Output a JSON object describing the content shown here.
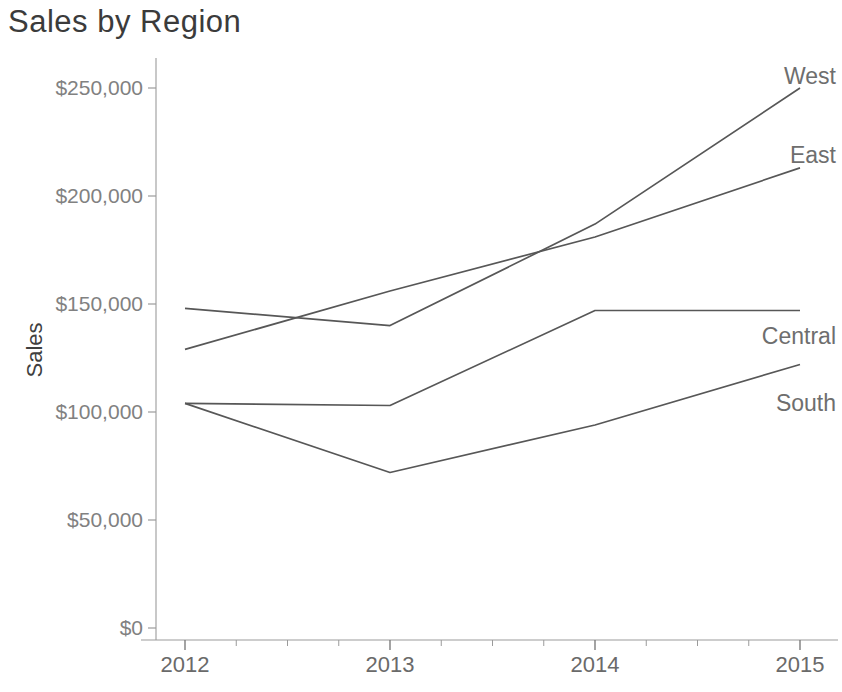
{
  "page": {
    "background_color": "#ffffff"
  },
  "chart_data": {
    "type": "line",
    "title": "Sales by Region",
    "xlabel": "",
    "ylabel": "Sales",
    "x": [
      2012,
      2013,
      2014,
      2015
    ],
    "x_tick_labels": [
      "2012",
      "2013",
      "2014",
      "2015"
    ],
    "y_ticks": [
      0,
      50000,
      100000,
      150000,
      200000,
      250000
    ],
    "y_tick_labels": [
      "$0",
      "$50,000",
      "$100,000",
      "$150,000",
      "$200,000",
      "$250,000"
    ],
    "ylim": [
      0,
      250000
    ],
    "grid": "off",
    "legend": "end-of-line-labels",
    "series": [
      {
        "name": "West",
        "values": [
          148000,
          140000,
          187000,
          250000
        ],
        "label_dy": -4
      },
      {
        "name": "East",
        "values": [
          129000,
          156000,
          181000,
          213000
        ],
        "label_dy": -5
      },
      {
        "name": "Central",
        "values": [
          104000,
          103000,
          147000,
          147000
        ],
        "label_dy": 34
      },
      {
        "name": "South",
        "values": [
          104000,
          72000,
          94000,
          122000
        ],
        "label_dy": 47
      }
    ],
    "colors": {
      "line": "#575757",
      "title": "#3b3b3b",
      "tick_label": "#818181",
      "year_label": "#6a6a6a",
      "axis": "#9b9b9b",
      "series_label": "#6e6e6e",
      "axis_title": "#3f3f3f"
    }
  }
}
